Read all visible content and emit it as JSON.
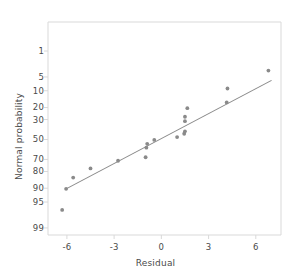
{
  "chart_data": {
    "type": "scatter",
    "title": "",
    "xlabel": "Residual",
    "ylabel": "Normal probability",
    "grid": false,
    "legend": null,
    "xlim": [
      -7.2,
      7.6
    ],
    "ylim_percent": [
      0.6,
      99.9
    ],
    "x_ticks": [
      -6,
      -3,
      0,
      3,
      6
    ],
    "y_ticks": [
      1,
      5,
      10,
      20,
      30,
      50,
      70,
      80,
      90,
      95,
      99
    ],
    "y_scale": "normal-probability",
    "point_color": "#8a8a8a",
    "line_color": "#8a8a8a",
    "axis_color": "#d9d9d9",
    "points": [
      {
        "x": -6.3,
        "y": 3.2
      },
      {
        "x": -6.05,
        "y": 9.7
      },
      {
        "x": -5.6,
        "y": 15.8
      },
      {
        "x": -4.5,
        "y": 22.3
      },
      {
        "x": -2.75,
        "y": 28.8
      },
      {
        "x": -1.0,
        "y": 32.0
      },
      {
        "x": -0.95,
        "y": 41.5
      },
      {
        "x": -0.9,
        "y": 45.5
      },
      {
        "x": -0.45,
        "y": 49.5
      },
      {
        "x": 1.0,
        "y": 52.5
      },
      {
        "x": 1.45,
        "y": 56.0
      },
      {
        "x": 1.5,
        "y": 58.5
      },
      {
        "x": 1.5,
        "y": 68.5
      },
      {
        "x": 1.5,
        "y": 72.5
      },
      {
        "x": 1.65,
        "y": 79.5
      },
      {
        "x": 4.15,
        "y": 83.5
      },
      {
        "x": 4.2,
        "y": 91.0
      },
      {
        "x": 6.8,
        "y": 96.5
      }
    ],
    "reference_line": {
      "x1": -6.05,
      "y1": 9.7,
      "x2": 7.0,
      "y2": 94.0
    }
  },
  "axes": {
    "x_tick_labels": [
      "-6",
      "-3",
      "0",
      "3",
      "6"
    ],
    "y_tick_labels": [
      "99",
      "95",
      "90",
      "80",
      "70",
      "50",
      "30",
      "20",
      "10",
      "5",
      "1"
    ],
    "x_title": "Residual",
    "y_title": "Normal probability"
  }
}
